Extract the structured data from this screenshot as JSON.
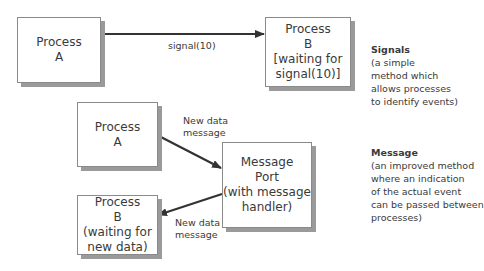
{
  "signals_section": {
    "process_a": {
      "lines": [
        "Process",
        "A"
      ]
    },
    "process_b": {
      "lines": [
        "Process",
        "B",
        "[waiting for",
        "signal(10)]"
      ]
    },
    "arrow_label": "signal(10)",
    "note": {
      "title": "Signals",
      "lines": [
        "(a simple",
        "method which",
        "allows processes",
        "to identify events)"
      ]
    }
  },
  "message_section": {
    "process_a": {
      "lines": [
        "Process",
        "A"
      ]
    },
    "message_port": {
      "lines": [
        "Message",
        "Port",
        "(with message",
        "handler)"
      ]
    },
    "process_b": {
      "lines": [
        "Process",
        "B",
        "(waiting for",
        "new data)"
      ]
    },
    "arrow_in_label": [
      "New data",
      "message"
    ],
    "arrow_out_label": [
      "New data",
      "message"
    ],
    "note": {
      "title": "Message",
      "lines": [
        "(an improved method",
        "where an indication",
        "of the actual event",
        "can be passed between",
        "processes)"
      ]
    }
  },
  "colors": {
    "line": "#333333",
    "box_border": "#8a8a8a",
    "shadow": "#9a9a9a",
    "text": "#3a3a3a"
  }
}
